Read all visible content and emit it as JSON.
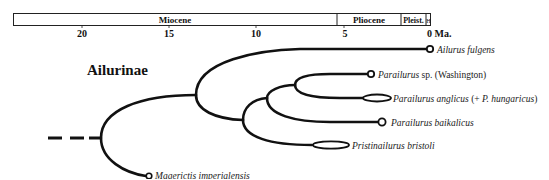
{
  "timescale": {
    "unit_label": "0 Ma.",
    "epochs": [
      {
        "name": "Miocene"
      },
      {
        "name": "Pliocene"
      },
      {
        "name": "Pleist."
      },
      {
        "name": "H"
      }
    ],
    "ticks": [
      "20",
      "15",
      "10",
      "5"
    ]
  },
  "clade": {
    "label": "Ailurinae"
  },
  "taxa": [
    {
      "name": "Ailurus fulgens",
      "suffix": "",
      "marker": "circle"
    },
    {
      "name": "Parailurus",
      "suffix": " sp. (Washington)",
      "marker": "circle"
    },
    {
      "name": "Parailurus anglicus",
      "suffix": " (+ ",
      "suffix_italic": "P. hungaricus",
      "suffix_end": ")",
      "marker": "ellipse"
    },
    {
      "name": "Parailurus baikalicus",
      "suffix": "",
      "marker": "circle"
    },
    {
      "name": "Pristinailurus bristoli",
      "suffix": "",
      "marker": "ellipse"
    },
    {
      "name": "Magerictis imperialensis",
      "suffix": "",
      "marker": "circle"
    }
  ],
  "colors": {
    "line": "#111111",
    "background": "#ffffff"
  }
}
